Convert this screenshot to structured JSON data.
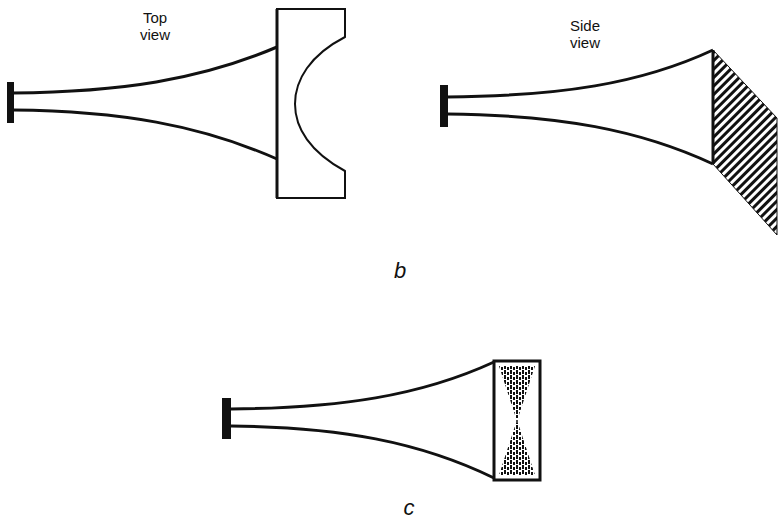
{
  "figure_b": {
    "label": "b",
    "top_view": {
      "label_line1": "Top",
      "label_line2": "view"
    },
    "side_view": {
      "label_line1": "Side",
      "label_line2": "view"
    }
  },
  "figure_c": {
    "label": "c"
  },
  "colors": {
    "stroke": "#111111",
    "background": "#ffffff"
  }
}
